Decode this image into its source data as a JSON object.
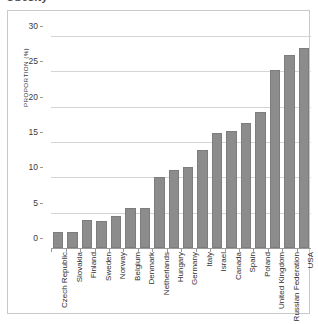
{
  "title_clipped": "Obesity",
  "chart_data": {
    "type": "bar",
    "title": "",
    "xlabel": "",
    "ylabel": "PROPORTION (%)",
    "ylim": [
      0,
      30
    ],
    "yticks": [
      0,
      5,
      10,
      15,
      20,
      25,
      30
    ],
    "ytick_labels": [
      "0",
      "5",
      "10",
      "15",
      "20",
      "25",
      "30"
    ],
    "grid": true,
    "legend": "none",
    "orientation": "vertical",
    "bar_color": "#8c8c8c",
    "bar_edge_color": "#7d7d7d",
    "gridline_color": "#d5d5d5",
    "axis_color": "#9a9a9a",
    "categories": [
      "Czech Republic",
      "Slovakia",
      "Finland",
      "Sweden",
      "Norway",
      "Belgium",
      "Denmark",
      "Netherlands",
      "Hungary",
      "Germany",
      "Italy",
      "Israel",
      "Canada",
      "Spain",
      "Poland",
      "United Kingdom",
      "Russian Federation",
      "USA"
    ],
    "values": [
      2.2,
      2.2,
      3.9,
      3.8,
      4.5,
      5.6,
      5.7,
      10.0,
      11.0,
      11.4,
      13.9,
      16.3,
      16.5,
      17.7,
      19.2,
      25.2,
      27.3,
      28.3
    ]
  }
}
